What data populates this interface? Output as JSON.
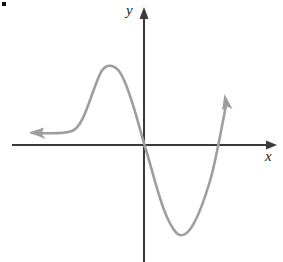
{
  "figure": {
    "background_color": "#ffffff",
    "width": 283,
    "height": 262,
    "corner_mark_label": ""
  },
  "axes": {
    "color": "#3a3a3a",
    "stroke_width": 2,
    "origin": {
      "x": 144,
      "y": 145
    },
    "x_axis": {
      "label": "x",
      "label_position": {
        "x": 265,
        "y": 149
      },
      "start": {
        "x": 12,
        "y": 145
      },
      "end": {
        "x": 277,
        "y": 145
      },
      "arrow": "right"
    },
    "y_axis": {
      "label": "y",
      "label_position": {
        "x": 126,
        "y": 3
      },
      "start": {
        "x": 144,
        "y": 262
      },
      "end": {
        "x": 144,
        "y": 8
      },
      "arrow": "up"
    }
  },
  "curve": {
    "color": "#9e9e9e",
    "stroke_width": 2.6,
    "description": "cubic-like curve with local maximum left of y-axis and local minimum right of y-axis",
    "left_arrow": "left",
    "right_arrow": "up-right",
    "path": "M 32 133 C 52 133, 62 134, 72 131 C 84 127, 90 96, 100 74 C 106 62, 116 62, 124 80 C 134 102, 140 132, 146 150 C 156 182, 164 220, 176 233 C 188 245, 200 214, 210 181 C 216 161, 222 126, 226 104",
    "left_arrowhead": {
      "tip": {
        "x": 30,
        "y": 133
      },
      "angle_deg": 188
    },
    "right_arrowhead": {
      "tip": {
        "x": 224,
        "y": 95
      },
      "angle_deg": -79
    },
    "features": {
      "local_maximum": {
        "x": 108,
        "y": 64
      },
      "local_minimum": {
        "x": 179,
        "y": 234
      },
      "x_intercepts": [
        {
          "x": 143,
          "y": 145
        },
        {
          "x": 219,
          "y": 145
        }
      ],
      "left_asymptotic_level_y": 133
    }
  },
  "chart_data": {
    "type": "line",
    "title": "",
    "xlabel": "x",
    "ylabel": "y",
    "grid": false,
    "legend": null,
    "axis_style": "arrows-both-ends",
    "series": [
      {
        "name": "cubic curve",
        "color": "#9e9e9e",
        "points_pixel": [
          [
            32,
            133
          ],
          [
            44,
            133
          ],
          [
            56,
            133
          ],
          [
            66,
            132
          ],
          [
            74,
            128
          ],
          [
            82,
            118
          ],
          [
            90,
            100
          ],
          [
            98,
            80
          ],
          [
            104,
            68
          ],
          [
            110,
            63
          ],
          [
            116,
            66
          ],
          [
            122,
            78
          ],
          [
            130,
            100
          ],
          [
            138,
            126
          ],
          [
            144,
            145
          ],
          [
            152,
            172
          ],
          [
            160,
            198
          ],
          [
            168,
            220
          ],
          [
            176,
            232
          ],
          [
            182,
            234
          ],
          [
            190,
            226
          ],
          [
            198,
            208
          ],
          [
            206,
            186
          ],
          [
            214,
            156
          ],
          [
            220,
            132
          ],
          [
            226,
            104
          ]
        ],
        "points_data": [
          [
            -5.6,
            -0.6
          ],
          [
            -4.0,
            -0.6
          ],
          [
            -3.1,
            -0.6
          ],
          [
            -2.6,
            -0.55
          ],
          [
            -2.3,
            -0.45
          ],
          [
            -1.9,
            0.15
          ],
          [
            -1.5,
            0.95
          ],
          [
            -1.1,
            1.8
          ],
          [
            -0.9,
            2.1
          ],
          [
            -0.7,
            2.2
          ],
          [
            -0.4,
            2.0
          ],
          [
            -0.15,
            1.5
          ],
          [
            0.2,
            0.8
          ],
          [
            0.55,
            -0.05
          ],
          [
            0.8,
            -0.6
          ],
          [
            1.2,
            -1.5
          ],
          [
            1.6,
            -2.4
          ],
          [
            2.0,
            -3.2
          ],
          [
            2.4,
            -3.6
          ],
          [
            2.7,
            -3.7
          ],
          [
            3.0,
            -3.4
          ],
          [
            3.3,
            -2.8
          ],
          [
            3.7,
            -2.0
          ],
          [
            4.1,
            -0.9
          ],
          [
            4.6,
            0.1
          ],
          [
            5.0,
            1.1
          ]
        ]
      }
    ],
    "annotations": [
      {
        "text": "local maximum",
        "pixel": [
          108,
          64
        ]
      },
      {
        "text": "local minimum",
        "pixel": [
          179,
          234
        ]
      }
    ],
    "xlim_pixel": [
      12,
      277
    ],
    "ylim_pixel": [
      262,
      8
    ]
  }
}
